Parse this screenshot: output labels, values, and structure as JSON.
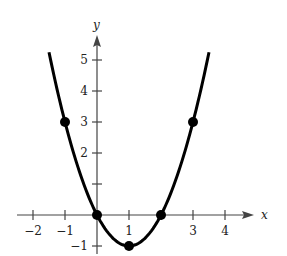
{
  "chart_data": {
    "type": "line",
    "title": "",
    "function": "y = x^2 - 2x",
    "xlabel": "x",
    "ylabel": "y",
    "xlim": [
      -2.3,
      4.5
    ],
    "ylim": [
      -1.3,
      5.8
    ],
    "x_ticks": [
      -2,
      -1,
      1,
      3,
      4
    ],
    "x_tick_marks": [
      -2,
      -1,
      0,
      1,
      2,
      3,
      4
    ],
    "y_ticks": [
      -1,
      2,
      3,
      4,
      5
    ],
    "y_tick_marks": [
      -1,
      1,
      2,
      3,
      4,
      5
    ],
    "points": [
      {
        "x": -1,
        "y": 3
      },
      {
        "x": 0,
        "y": 0
      },
      {
        "x": 1,
        "y": -1
      },
      {
        "x": 2,
        "y": 0
      },
      {
        "x": 3,
        "y": 3
      }
    ],
    "curve_x_range": [
      -1.5,
      3.5
    ],
    "grid": false,
    "colors": {
      "curve": "#000000",
      "axes": "#444444"
    }
  },
  "labels": {
    "x_axis": "x",
    "y_axis": "y",
    "tick_labels_x": [
      "−2",
      "−1",
      "1",
      "3",
      "4"
    ],
    "tick_labels_y": [
      "−1",
      "2",
      "3",
      "4",
      "5"
    ]
  }
}
